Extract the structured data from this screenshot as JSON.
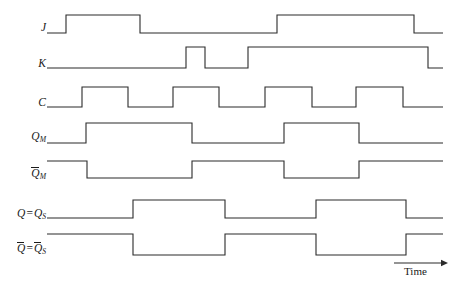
{
  "diagram": {
    "axis": {
      "time_label": "Time",
      "arrow": {
        "x1": 394,
        "x2": 448,
        "y": 263
      }
    },
    "geometry": {
      "width": 456,
      "height": 293,
      "wave_start_x": 47,
      "wave_end_x": 443,
      "stroke_color": "#2b2b2b",
      "background": "#ffffff"
    },
    "signals": [
      {
        "name": "J",
        "label_html": "J",
        "label_text": "J",
        "overbar": false,
        "subscript": "",
        "label_y": 22,
        "high_y": 15,
        "low_y": 33,
        "initial_level": 0,
        "transitions": [
          {
            "x": 66,
            "to": 1
          },
          {
            "x": 140,
            "to": 0
          },
          {
            "x": 277,
            "to": 1
          },
          {
            "x": 414,
            "to": 0
          }
        ]
      },
      {
        "name": "K",
        "label_html": "K",
        "label_text": "K",
        "overbar": false,
        "subscript": "",
        "label_y": 58,
        "high_y": 47,
        "low_y": 68,
        "initial_level": 0,
        "transitions": [
          {
            "x": 186,
            "to": 1
          },
          {
            "x": 205,
            "to": 0
          },
          {
            "x": 248,
            "to": 1
          },
          {
            "x": 428,
            "to": 0
          }
        ]
      },
      {
        "name": "C",
        "label_html": "C",
        "label_text": "C",
        "overbar": false,
        "subscript": "",
        "label_y": 97,
        "high_y": 87,
        "low_y": 107,
        "initial_level": 0,
        "transitions": [
          {
            "x": 82,
            "to": 1
          },
          {
            "x": 128,
            "to": 0
          },
          {
            "x": 173,
            "to": 1
          },
          {
            "x": 219,
            "to": 0
          },
          {
            "x": 265,
            "to": 1
          },
          {
            "x": 312,
            "to": 0
          },
          {
            "x": 356,
            "to": 1
          },
          {
            "x": 403,
            "to": 0
          }
        ]
      },
      {
        "name": "Q_M",
        "label_html": "Q_M",
        "label_text": "QM",
        "overbar": false,
        "subscript": "M",
        "label_y": 131,
        "high_y": 123,
        "low_y": 143,
        "initial_level": 0,
        "transitions": [
          {
            "x": 86,
            "to": 1
          },
          {
            "x": 192,
            "to": 0
          },
          {
            "x": 284,
            "to": 1
          },
          {
            "x": 359,
            "to": 0
          }
        ]
      },
      {
        "name": "Qbar_M",
        "label_html": "Q̄_M",
        "label_text": "QM",
        "overbar": true,
        "subscript": "M",
        "label_y": 168,
        "high_y": 161,
        "low_y": 178,
        "initial_level": 1,
        "transitions": [
          {
            "x": 87,
            "to": 0
          },
          {
            "x": 192,
            "to": 1
          },
          {
            "x": 284,
            "to": 0
          },
          {
            "x": 359,
            "to": 1
          }
        ]
      },
      {
        "name": "Q_eq_QS",
        "label_html": "Q = Q_S",
        "label_text": "Q = QS",
        "overbar": false,
        "subscript": "S",
        "label_y": 208,
        "high_y": 200,
        "low_y": 218,
        "initial_level": 0,
        "transitions": [
          {
            "x": 133,
            "to": 1
          },
          {
            "x": 225,
            "to": 0
          },
          {
            "x": 316,
            "to": 1
          },
          {
            "x": 406,
            "to": 0
          }
        ]
      },
      {
        "name": "Qbar_eq_QbarS",
        "label_html": "Q̄ = Q̄_S",
        "label_text": "Q = QS",
        "overbar": true,
        "subscript": "S",
        "label_y": 243,
        "high_y": 234,
        "low_y": 255,
        "initial_level": 1,
        "transitions": [
          {
            "x": 133,
            "to": 0
          },
          {
            "x": 225,
            "to": 1
          },
          {
            "x": 316,
            "to": 0
          },
          {
            "x": 406,
            "to": 1
          }
        ]
      }
    ]
  }
}
